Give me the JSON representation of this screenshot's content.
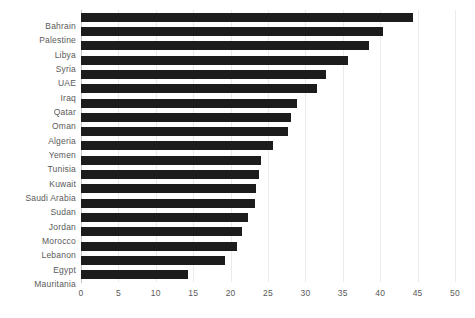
{
  "chart_data": {
    "type": "bar",
    "orientation": "horizontal",
    "title": "",
    "subtitle": "",
    "xlabel": "",
    "ylabel": "",
    "xlim": [
      0,
      50
    ],
    "xticks": [
      "0",
      "5",
      "10",
      "15",
      "20",
      "25",
      "30",
      "35",
      "40",
      "45",
      "50"
    ],
    "xtick_values": [
      0,
      5,
      10,
      15,
      20,
      25,
      30,
      35,
      40,
      45,
      50
    ],
    "grid": true,
    "grid_axis": "x",
    "legend": false,
    "legend_position": "none",
    "bar_color": "#1c1c1c",
    "background_color": "#ffffff",
    "gridline_color": "#ebebeb",
    "tick_label_color": "#5a5a5a",
    "categories": [
      "Bahrain",
      "Palestine",
      "Libya",
      "Syria",
      "UAE",
      "Iraq",
      "Qatar",
      "Oman",
      "Algeria",
      "Yemen",
      "Tunisia",
      "Kuwait",
      "Saudi  Arabia",
      "Sudan",
      "Jordan",
      "Morocco",
      "Lebanon",
      "Egypt",
      "Mauritania"
    ],
    "values": [
      44.4,
      40.4,
      38.5,
      35.7,
      32.8,
      31.5,
      28.9,
      28.1,
      27.7,
      25.7,
      24.1,
      23.8,
      23.4,
      23.3,
      22.3,
      21.5,
      20.9,
      19.3,
      14.3
    ]
  }
}
